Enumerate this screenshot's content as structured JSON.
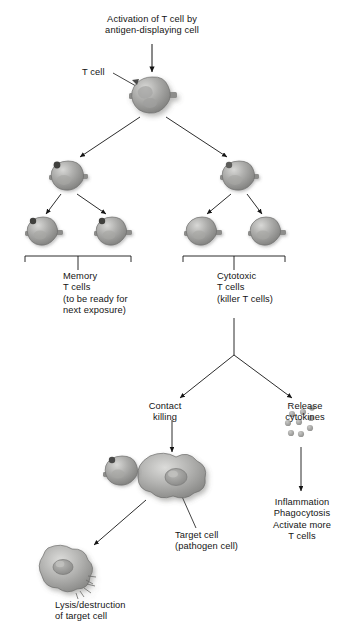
{
  "diagram": {
    "background": "#ffffff",
    "ink": "#141414",
    "cell_fill": "#9a9a9a",
    "labels": {
      "activation": "Activation of T cell by\nantigen-displaying cell",
      "t_cell": "T cell",
      "memory": "Memory\nT cells\n(to be ready for\nnext exposure)",
      "cytotoxic": "Cytotoxic\nT cells\n(killer T cells)",
      "contact_killing": "Contact\nkilling",
      "release_cytokines": "Release\ncytokines",
      "outcomes": "Inflammation\nPhagocytosis\nActivate more\nT cells",
      "target_cell": "Target cell\n(pathogen cell)",
      "lysis": "Lysis/destruction\nof target cell"
    },
    "nodes": [
      {
        "name": "activated-t-cell",
        "kind": "t-cell",
        "x": 152,
        "y": 96,
        "r": 19,
        "nub": false
      },
      {
        "name": "memory-parent-t-cell",
        "kind": "t-cell",
        "x": 68,
        "y": 176,
        "r": 16,
        "nub": true
      },
      {
        "name": "cytotoxic-parent-t-cell",
        "kind": "t-cell",
        "x": 239,
        "y": 176,
        "r": 16,
        "nub": true
      },
      {
        "name": "memory-t-cell-left",
        "kind": "t-cell",
        "x": 43,
        "y": 231,
        "r": 15,
        "nub": true
      },
      {
        "name": "memory-t-cell-right",
        "kind": "t-cell",
        "x": 112,
        "y": 231,
        "r": 15,
        "nub": true
      },
      {
        "name": "cytotoxic-t-cell-left",
        "kind": "t-cell",
        "x": 202,
        "y": 231,
        "r": 15,
        "nub": false
      },
      {
        "name": "cytotoxic-t-cell-right",
        "kind": "t-cell",
        "x": 266,
        "y": 231,
        "r": 15,
        "nub": false
      },
      {
        "name": "attacking-t-cell",
        "kind": "t-cell",
        "x": 122,
        "y": 470,
        "r": 16,
        "nub": true
      },
      {
        "name": "target-cell",
        "kind": "target-cell",
        "x": 166,
        "y": 481,
        "r": 30
      },
      {
        "name": "lysed-cell",
        "kind": "lysed-cell",
        "x": 62,
        "y": 570,
        "r": 27
      },
      {
        "name": "cytokine-cluster",
        "kind": "cytokines",
        "x": 301,
        "y": 425,
        "r": 17,
        "count": 9
      }
    ],
    "brackets": [
      {
        "name": "memory-bracket",
        "x1": 25,
        "x2": 131,
        "y": 256,
        "tick_x": 78
      },
      {
        "name": "cytotoxic-bracket",
        "x1": 183,
        "x2": 285,
        "y": 256,
        "tick_x": 234
      }
    ]
  }
}
